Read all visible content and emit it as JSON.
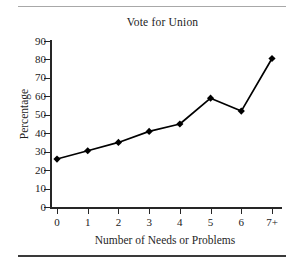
{
  "figure": {
    "title": "Vote for Union",
    "rules": {
      "top_color": "#a8a8a8",
      "bottom_color": "#3a3a3a"
    }
  },
  "chart_data": {
    "type": "line",
    "title": "Vote for Union",
    "xlabel": "Number of Needs or Problems",
    "ylabel": "Percentage",
    "categories": [
      "0",
      "1",
      "2",
      "3",
      "4",
      "5",
      "6",
      "7+"
    ],
    "x": [
      0,
      1,
      2,
      3,
      4,
      5,
      6,
      7
    ],
    "values": [
      26,
      30.5,
      35,
      41,
      45,
      59,
      52,
      80.5
    ],
    "series": [
      {
        "name": "Vote for Union",
        "values": [
          26,
          30.5,
          35,
          41,
          45,
          59,
          52,
          80.5
        ],
        "color": "#000000",
        "marker": "diamond"
      }
    ],
    "ylim": [
      0,
      90
    ],
    "yticks": [
      0,
      10,
      20,
      30,
      40,
      50,
      60,
      70,
      80,
      90
    ],
    "ytick_labels": [
      "0",
      "10",
      "20",
      "30",
      "40",
      "50",
      "60",
      "70",
      "80",
      "90"
    ],
    "xtick_labels": [
      "0",
      "1",
      "2",
      "3",
      "4",
      "5",
      "6",
      "7+"
    ],
    "grid": false,
    "legend": false,
    "line_color": "#000000",
    "marker_color": "#000000"
  }
}
